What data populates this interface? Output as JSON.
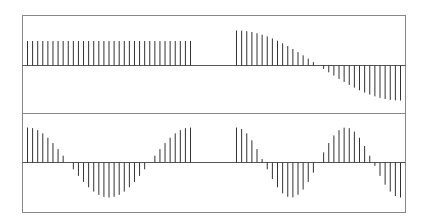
{
  "chart_data": {
    "type": "stem",
    "title": "",
    "layout": {
      "rows": 2,
      "cols": 1,
      "description": "Two stacked panels, each showing two 33-sample stem sequences side by side separated by a gap"
    },
    "grid": false,
    "legend": null,
    "colors": {
      "stem": "#333333",
      "frame": "#888888",
      "baseline": "#555555"
    },
    "panels": [
      {
        "name": "top",
        "series": [
          {
            "name": "constant",
            "n": 33,
            "formula": "0.7",
            "values": [
              0.7,
              0.7,
              0.7,
              0.7,
              0.7,
              0.7,
              0.7,
              0.7,
              0.7,
              0.7,
              0.7,
              0.7,
              0.7,
              0.7,
              0.7,
              0.7,
              0.7,
              0.7,
              0.7,
              0.7,
              0.7,
              0.7,
              0.7,
              0.7,
              0.7,
              0.7,
              0.7,
              0.7,
              0.7,
              0.7,
              0.7,
              0.7,
              0.7
            ]
          },
          {
            "name": "half-cosine",
            "n": 33,
            "formula": "cos(pi*k/32)",
            "values": []
          }
        ],
        "ylim": [
          -1.4,
          1.4
        ]
      },
      {
        "name": "bottom",
        "series": [
          {
            "name": "cosine-1-period",
            "n": 33,
            "formula": "cos(2*pi*k/32)",
            "values": []
          },
          {
            "name": "cosine-1.5-period",
            "n": 33,
            "formula": "cos(3*pi*k/32)",
            "values": []
          }
        ],
        "ylim": [
          -1.4,
          1.4
        ]
      }
    ]
  }
}
